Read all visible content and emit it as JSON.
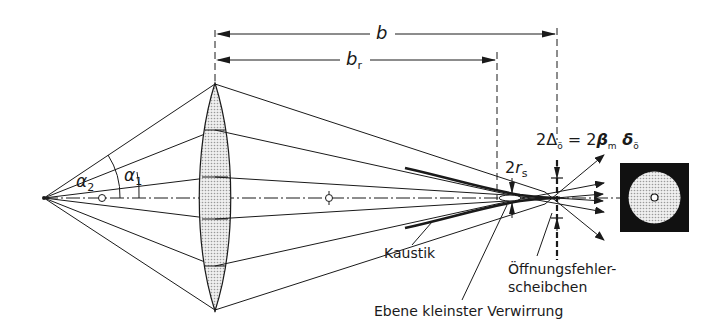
{
  "figure": {
    "colors": {
      "ink": "#1a1a1a",
      "lens_fill": "#d6d6d6",
      "disc_fill": "#d9d9d9",
      "background": "#ffffff"
    }
  },
  "dimensions": {
    "b": {
      "symbol": "b"
    },
    "b_r": {
      "symbol": "b",
      "subscript": "r"
    }
  },
  "angles": {
    "alpha2": {
      "symbol": "α",
      "subscript": "2"
    },
    "alpha1": {
      "symbol": "α",
      "subscript": "1"
    }
  },
  "labels": {
    "rs": {
      "prefix": "2",
      "symbol": "r",
      "subscript": "s"
    },
    "delta_formula": {
      "text_left": "2Δ",
      "sub_left": "ö",
      "eq": " = 2",
      "beta": "β",
      "beta_sub": "m",
      "delta": " δ",
      "delta_sub": "ö"
    },
    "kaustik": "Kaustik",
    "oeffnungsfehler_line1": "Öffnungsfehler-",
    "oeffnungsfehler_line2": "scheibchen",
    "ebene": "Ebene kleinster Verwirrung"
  },
  "elements": {
    "object_point": "point-source",
    "lens": "biconvex-lens",
    "focal_point_left": "focal-marker",
    "focal_point_right": "focal-marker",
    "disc_inset": "aberration-disc"
  }
}
